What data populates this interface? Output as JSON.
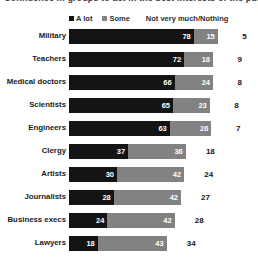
{
  "title": {
    "text": "Confidence in groups to act in the best interests of the public"
  },
  "legend": {
    "items": [
      {
        "label": "A lot",
        "color": "#141414",
        "swatch": true
      },
      {
        "label": "Some",
        "color": "#828282",
        "swatch": true
      },
      {
        "label": "Not very much/Nothing",
        "color": "#151515",
        "swatch": false
      }
    ]
  },
  "chart_data": {
    "type": "bar",
    "subtype": "stacked-horizontal",
    "title": "Confidence in groups to act in the best interests of the public",
    "xlabel": "",
    "ylabel": "",
    "xlim": [
      0,
      100
    ],
    "grid": false,
    "legend_position": "top",
    "categories": [
      "Military",
      "Teachers",
      "Medical doctors",
      "Scientists",
      "Engineers",
      "Clergy",
      "Artists",
      "Journalists",
      "Business execs",
      "Lawyers"
    ],
    "series": [
      {
        "name": "A lot",
        "color": "#141414",
        "values": [
          78,
          72,
          66,
          65,
          63,
          37,
          30,
          28,
          24,
          18
        ]
      },
      {
        "name": "Some",
        "color": "#828282",
        "values": [
          15,
          18,
          24,
          23,
          26,
          36,
          42,
          42,
          42,
          43
        ]
      },
      {
        "name": "Not very much/Nothing",
        "color": "#151515",
        "values": [
          5,
          9,
          8,
          8,
          7,
          18,
          24,
          27,
          28,
          34
        ]
      }
    ]
  }
}
